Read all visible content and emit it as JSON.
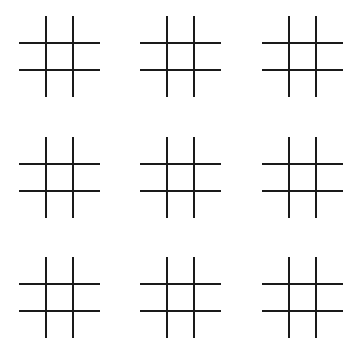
{
  "game": {
    "name": "Tic-tac-toe boards",
    "line_color": "#1a1a1a",
    "background": "#ffffff",
    "boards": [
      {
        "id": 1,
        "left": 19,
        "top": 16,
        "cells": [
          "",
          "",
          "",
          "",
          "",
          "",
          "",
          "",
          ""
        ]
      },
      {
        "id": 2,
        "left": 140,
        "top": 16,
        "cells": [
          "",
          "",
          "",
          "",
          "",
          "",
          "",
          "",
          ""
        ]
      },
      {
        "id": 3,
        "left": 262,
        "top": 16,
        "cells": [
          "",
          "",
          "",
          "",
          "",
          "",
          "",
          "",
          ""
        ]
      },
      {
        "id": 4,
        "left": 19,
        "top": 137,
        "cells": [
          "",
          "",
          "",
          "",
          "",
          "",
          "",
          "",
          ""
        ]
      },
      {
        "id": 5,
        "left": 140,
        "top": 137,
        "cells": [
          "",
          "",
          "",
          "",
          "",
          "",
          "",
          "",
          ""
        ]
      },
      {
        "id": 6,
        "left": 262,
        "top": 137,
        "cells": [
          "",
          "",
          "",
          "",
          "",
          "",
          "",
          "",
          ""
        ]
      },
      {
        "id": 7,
        "left": 19,
        "top": 257,
        "cells": [
          "",
          "",
          "",
          "",
          "",
          "",
          "",
          "",
          ""
        ]
      },
      {
        "id": 8,
        "left": 140,
        "top": 257,
        "cells": [
          "",
          "",
          "",
          "",
          "",
          "",
          "",
          "",
          ""
        ]
      },
      {
        "id": 9,
        "left": 262,
        "top": 257,
        "cells": [
          "",
          "",
          "",
          "",
          "",
          "",
          "",
          "",
          ""
        ]
      }
    ]
  }
}
